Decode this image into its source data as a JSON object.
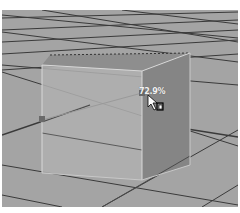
{
  "viewport": {
    "name": "3d-perspective-viewport",
    "object": "cube",
    "scale_readout": "72.9%",
    "colors": {
      "ground": "#a4a4a4",
      "grid_line": "#3a3a3a",
      "cube_front": "#b0b0b0",
      "cube_side": "#858585",
      "cube_top": "#8e8e8e",
      "edge_highlight": "#d8d8d8",
      "manipulator_handle": "#6a6a6a"
    }
  },
  "cursor": {
    "icon": "scale-cursor-icon"
  }
}
